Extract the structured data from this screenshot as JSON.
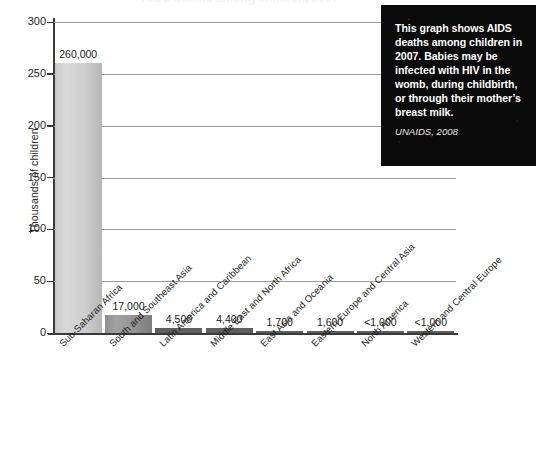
{
  "chart_data": {
    "type": "bar",
    "title": "AIDS deaths among children, 2007",
    "xlabel": "",
    "ylabel": "Thousands of children",
    "ylim": [
      0,
      300
    ],
    "yticks": [
      0,
      50,
      100,
      150,
      200,
      250,
      300
    ],
    "ytick_labels": [
      "0",
      "50",
      "100",
      "150",
      "200",
      "250",
      "300"
    ],
    "grid": true,
    "legend": "none",
    "categories": [
      "Sub-Saharan Africa",
      "South and Southeast Asia",
      "Latin America and Caribbean",
      "Middle East and North Africa",
      "East Asia and Oceania",
      "Eastern Europe and Central Asia",
      "North America",
      "Western and Central Europe"
    ],
    "values": [
      260,
      17,
      4.5,
      4.4,
      1.7,
      1.6,
      0.8,
      0.8
    ],
    "data_labels": [
      "260,000",
      "17,000",
      "4,500",
      "4,400",
      "1,700",
      "1,600",
      "<1,000",
      "<1,000"
    ],
    "units": "thousands of children"
  },
  "callout": {
    "text": "This graph shows AIDS deaths among children in 2007. Babies may be infected with HIV in the womb, during childbirth, or through their mother’s breast milk.",
    "source": "UNAIDS, 2008",
    "background_color": "#0a0a0a",
    "text_color": "#ffffff"
  },
  "style": {
    "bar_color_light": "#cfcfcf",
    "bar_color_dark": "#949494",
    "axis_color": "#3a3a3a",
    "grid_color": "#9a9a9a"
  }
}
